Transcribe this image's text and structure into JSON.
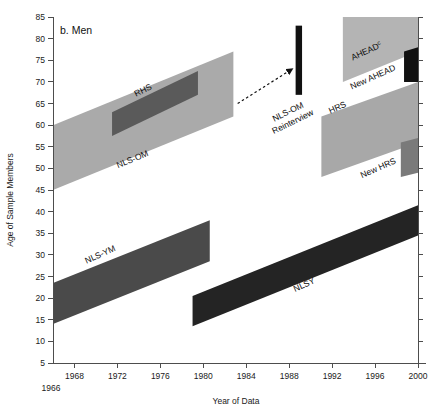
{
  "figure": {
    "panel_title": "b. Men",
    "background_color": "#ffffff"
  },
  "chart_data": {
    "type": "area",
    "title": "b. Men",
    "xlabel": "Year of Data",
    "ylabel": "Age of Sample Members",
    "xlim": [
      1966,
      2000
    ],
    "ylim": [
      5,
      85
    ],
    "grid": false,
    "legend": "none (in-band labels)",
    "x_ticks": [
      1968,
      1972,
      1976,
      1980,
      1984,
      1988,
      1992,
      1996,
      2000
    ],
    "x_tick_labels": [
      "1968",
      "1972",
      "1976",
      "1980",
      "1984",
      "1988",
      "1992",
      "1996",
      "2000"
    ],
    "x_origin_label": "1966",
    "y_ticks": [
      5,
      10,
      15,
      20,
      25,
      30,
      35,
      40,
      45,
      50,
      55,
      60,
      65,
      70,
      75,
      80,
      85
    ],
    "y_tick_labels": [
      "5",
      "10",
      "15",
      "20",
      "25",
      "30",
      "35",
      "40",
      "45",
      "50",
      "55",
      "60",
      "65",
      "70",
      "75",
      "80",
      "85"
    ],
    "series": [
      {
        "name": "NLS-OM",
        "label": "NLS-OM",
        "color": "#aaaaaa",
        "shape": "parallelogram",
        "x_start": 1966,
        "x_end": 1982.8,
        "age_top_start": 60,
        "age_bottom_start": 45,
        "age_top_end": 77,
        "age_bottom_end": 62,
        "label_x": 1973.5,
        "label_y": 51.5,
        "label_rotation": -22
      },
      {
        "name": "RHS",
        "label": "RHS",
        "color": "#5a5a5a",
        "shape": "parallelogram",
        "x_start": 1971.5,
        "x_end": 1979.5,
        "age_top_start": 63,
        "age_bottom_start": 57.5,
        "age_top_end": 72.5,
        "age_bottom_end": 67,
        "label_x": 1974.5,
        "label_y": 67.5,
        "label_rotation": -26
      },
      {
        "name": "NLS-OM Reinterview",
        "label": "NLS-OM\nReinterview",
        "color": "#111111",
        "shape": "bar",
        "x_start": 1988.6,
        "x_end": 1989.2,
        "age_top_start": 83,
        "age_bottom_start": 67,
        "age_top_end": 83,
        "age_bottom_end": 67,
        "label_x": 1988.0,
        "label_y": 62.5,
        "label_rotation": -26
      },
      {
        "name": "AHEAD",
        "label": "AHEAD",
        "label_superscript": "c",
        "color": "#b4b4b4",
        "shape": "parallelogram",
        "x_start": 1993,
        "x_end": 2000,
        "age_top_start": 85,
        "age_bottom_start": 70,
        "age_top_end": 85,
        "age_bottom_end": 77,
        "label_x": 1995.3,
        "label_y": 76.5,
        "label_rotation": -24
      },
      {
        "name": "New AHEAD",
        "label": "New AHEAD",
        "color": "#111111",
        "shape": "parallelogram",
        "x_start": 1998.7,
        "x_end": 2000,
        "age_top_start": 77,
        "age_bottom_start": 70,
        "age_top_end": 78,
        "age_bottom_end": 70,
        "label_x": 1995.9,
        "label_y": 70.5,
        "label_rotation": -24
      },
      {
        "name": "HRS",
        "label": "HRS",
        "color": "#a8a8a8",
        "shape": "parallelogram",
        "x_start": 1991,
        "x_end": 2000,
        "age_top_start": 62,
        "age_bottom_start": 48,
        "age_top_end": 70,
        "age_bottom_end": 56,
        "label_x": 1992.6,
        "label_y": 63.5,
        "label_rotation": -24
      },
      {
        "name": "New HRS",
        "label": "New HRS",
        "color": "#7a7a7a",
        "shape": "parallelogram",
        "x_start": 1998.4,
        "x_end": 2000,
        "age_top_start": 56,
        "age_bottom_start": 48,
        "age_top_end": 57,
        "age_bottom_end": 49,
        "label_x": 1996.4,
        "label_y": 49.5,
        "label_rotation": -24
      },
      {
        "name": "NLS-YM",
        "label": "NLS-YM",
        "color": "#4a4a4a",
        "shape": "parallelogram",
        "x_start": 1966,
        "x_end": 1980.6,
        "age_top_start": 23.5,
        "age_bottom_start": 14,
        "age_top_end": 38,
        "age_bottom_end": 28.5,
        "label_x": 1970.5,
        "label_y": 29.5,
        "label_rotation": -24
      },
      {
        "name": "NLSY",
        "label": "NLSY",
        "color": "#242424",
        "shape": "parallelogram",
        "x_start": 1979,
        "x_end": 2000,
        "age_top_start": 20.5,
        "age_bottom_start": 13.5,
        "age_top_end": 41.5,
        "age_bottom_end": 34.5,
        "label_x": 1989.5,
        "label_y": 22.5,
        "label_rotation": -24
      }
    ],
    "annotations": [
      {
        "name": "nlsom-reinterview-arrow",
        "type": "dashed-arrow",
        "from_x": 1983.2,
        "from_y": 65.0,
        "to_x": 1988.3,
        "to_y": 73.0
      }
    ]
  }
}
